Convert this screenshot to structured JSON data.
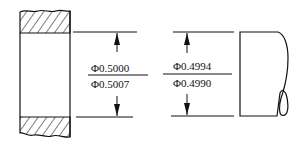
{
  "diagram": {
    "type": "hole-and-shaft fit tolerance drawing",
    "colors": {
      "line": "#111111",
      "background": "#ffffff"
    },
    "hole": {
      "name": "bushing / hole (sectioned)",
      "upper_limit_label": "Φ0.5000",
      "lower_limit_label": "Φ0.5007"
    },
    "shaft": {
      "name": "shaft (broken-out end)",
      "upper_limit_label": "Φ0.4994",
      "lower_limit_label": "Φ0.4990"
    }
  }
}
